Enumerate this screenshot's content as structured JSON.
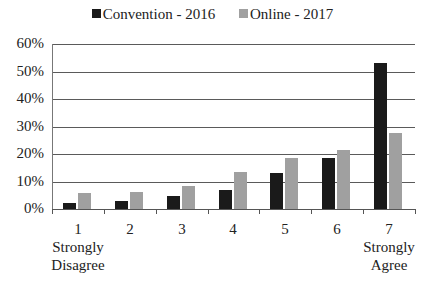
{
  "chart_data": {
    "type": "bar",
    "title": "",
    "xlabel": "",
    "ylabel": "",
    "ylim": [
      0,
      60
    ],
    "yticks": [
      "0%",
      "10%",
      "20%",
      "30%",
      "40%",
      "50%",
      "60%"
    ],
    "categories": [
      "1",
      "2",
      "3",
      "4",
      "5",
      "6",
      "7"
    ],
    "category_sublabels": [
      "Strongly Disagree",
      "",
      "",
      "",
      "",
      "",
      "Strongly Agree"
    ],
    "series": [
      {
        "name": "Convention - 2016",
        "color": "#1a1a1a",
        "values": [
          2.2,
          3.0,
          4.8,
          7.0,
          13.1,
          18.5,
          53.0
        ]
      },
      {
        "name": "Online - 2017",
        "color": "#a0a0a0",
        "values": [
          5.9,
          6.3,
          8.5,
          13.3,
          18.7,
          21.5,
          27.8
        ]
      }
    ],
    "legend_position": "top",
    "grid": true
  },
  "legend": {
    "items": [
      {
        "label": "Convention - 2016",
        "color": "#1a1a1a"
      },
      {
        "label": "Online - 2017",
        "color": "#a0a0a0"
      }
    ]
  },
  "x_labels": [
    {
      "num": "1",
      "sub1": "Strongly",
      "sub2": "Disagree"
    },
    {
      "num": "2",
      "sub1": "",
      "sub2": ""
    },
    {
      "num": "3",
      "sub1": "",
      "sub2": ""
    },
    {
      "num": "4",
      "sub1": "",
      "sub2": ""
    },
    {
      "num": "5",
      "sub1": "",
      "sub2": ""
    },
    {
      "num": "6",
      "sub1": "",
      "sub2": ""
    },
    {
      "num": "7",
      "sub1": "Strongly",
      "sub2": "Agree"
    }
  ]
}
